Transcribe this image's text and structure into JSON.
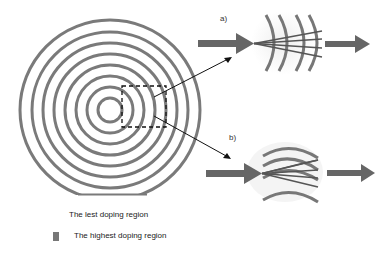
{
  "colors": {
    "ring": "#7a7a7a",
    "arrow": "#666666",
    "pointer_line": "#111111",
    "dashed_box": "#111111",
    "wave_bg": "#f2f2f2"
  },
  "labels": {
    "panel_a": "a)",
    "panel_b": "b)"
  },
  "legend": {
    "items": [
      {
        "label": "The lest doping region",
        "swatch": "none"
      },
      {
        "label": "The highest doping region",
        "swatch": "#777777"
      }
    ]
  },
  "figure": {
    "concentric_rings": 8,
    "left_component": "concentric-ring-lens",
    "zoom_box": "dashed-rectangle",
    "panel_a": "converging-rays-through-curved-fronts",
    "panel_b": "rays-through-alternating-curved-layers"
  }
}
